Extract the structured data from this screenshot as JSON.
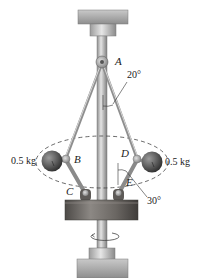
{
  "figure": {
    "type": "flyball-governor",
    "points": {
      "A": "A",
      "B": "B",
      "C": "C",
      "D": "D",
      "E": "E"
    },
    "angles": {
      "upper": "20°",
      "lower": "30°"
    },
    "masses": {
      "left": "0.5 kg",
      "right": "0.5 kg"
    },
    "colors": {
      "plate": "#a8a8a8",
      "shaft": "#c4c4c4",
      "collar": "#6e6a66",
      "ball": "#5a5a5a",
      "dashed_path": "#444444"
    }
  }
}
